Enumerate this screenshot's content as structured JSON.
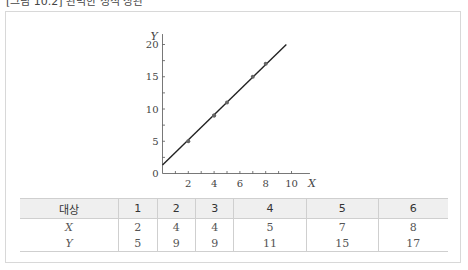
{
  "caption": "[그림 10.2] 완벽한 정적 상관",
  "chart_data": {
    "type": "scatter",
    "title": "",
    "xlabel": "X",
    "ylabel": "Y",
    "xlim": [
      0,
      10.5
    ],
    "ylim": [
      0,
      21
    ],
    "x_ticks": [
      2,
      4,
      6,
      8,
      10
    ],
    "y_ticks": [
      0,
      5,
      10,
      15,
      20
    ],
    "grid": false,
    "points": [
      {
        "x": 2,
        "y": 5
      },
      {
        "x": 4,
        "y": 9
      },
      {
        "x": 4,
        "y": 9
      },
      {
        "x": 5,
        "y": 11
      },
      {
        "x": 7,
        "y": 15
      },
      {
        "x": 8,
        "y": 17
      }
    ],
    "fit_line": {
      "equation": "Y = 2X + 1",
      "from": {
        "x": 0,
        "y": 1.3
      },
      "to": {
        "x": 9.6,
        "y": 20
      }
    }
  },
  "table": {
    "header": [
      "대상",
      "1",
      "2",
      "3",
      "4",
      "5",
      "6"
    ],
    "rows": [
      {
        "label": "X",
        "values": [
          "2",
          "4",
          "4",
          "5",
          "7",
          "8"
        ]
      },
      {
        "label": "Y",
        "values": [
          "5",
          "9",
          "9",
          "11",
          "15",
          "17"
        ]
      }
    ]
  }
}
